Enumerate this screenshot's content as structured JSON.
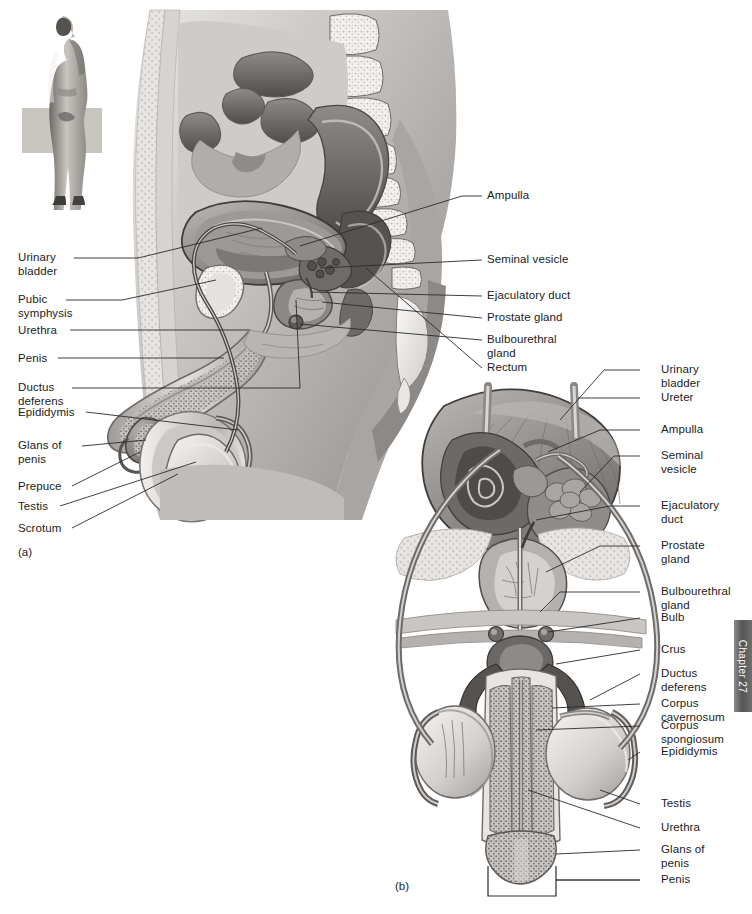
{
  "figure": {
    "background_color": "#ffffff",
    "line_color": "#2b2b2b",
    "panels": [
      {
        "tag": "(a)",
        "view": "sagittal-section"
      },
      {
        "tag": "(b)",
        "view": "anterior-view"
      }
    ]
  },
  "chapter_tab": {
    "text": "Chapter 27",
    "color": "#5a5a5a"
  },
  "panel_a": {
    "tag": "(a)",
    "orientation_figure": "standing-male-lateral-silhouette",
    "labels_left": [
      {
        "text": "Urinary\nbladder"
      },
      {
        "text": "Pubic\nsymphysis"
      },
      {
        "text": "Urethra"
      },
      {
        "text": "Penis"
      },
      {
        "text": "Ductus\ndeferens"
      },
      {
        "text": "Epididymis"
      },
      {
        "text": "Glans of\npenis"
      },
      {
        "text": "Prepuce"
      },
      {
        "text": "Testis"
      },
      {
        "text": "Scrotum"
      }
    ],
    "labels_right": [
      {
        "text": "Ampulla"
      },
      {
        "text": "Seminal vesicle"
      },
      {
        "text": "Ejaculatory duct"
      },
      {
        "text": "Prostate gland"
      },
      {
        "text": "Bulbourethral\ngland"
      },
      {
        "text": "Rectum"
      }
    ]
  },
  "panel_b": {
    "tag": "(b)",
    "labels_right": [
      {
        "text": "Urinary\nbladder"
      },
      {
        "text": "Ureter"
      },
      {
        "text": "Ampulla"
      },
      {
        "text": "Seminal\nvesicle"
      },
      {
        "text": "Ejaculatory\nduct"
      },
      {
        "text": "Prostate\ngland"
      },
      {
        "text": "Bulbourethral\ngland"
      },
      {
        "text": "Bulb"
      },
      {
        "text": "Crus"
      },
      {
        "text": "Ductus\ndeferens"
      },
      {
        "text": "Corpus\ncavernosum"
      },
      {
        "text": "Corpus\nspongiosum"
      },
      {
        "text": "Epididymis"
      },
      {
        "text": "Testis"
      },
      {
        "text": "Urethra"
      },
      {
        "text": "Glans of\npenis"
      },
      {
        "text": "Penis"
      }
    ]
  }
}
